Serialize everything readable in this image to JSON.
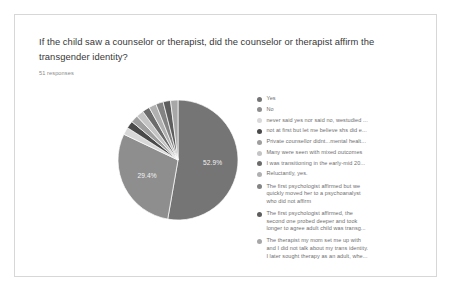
{
  "card": {
    "question": "If the child saw a counselor or therapist, did the counselor or therapist affirm the transgender identity?",
    "response_count": "51 responses"
  },
  "chart_data": {
    "type": "pie",
    "title": "If the child saw a counselor or therapist, did the counselor or therapist affirm the transgender identity?",
    "subtitle": "51 responses",
    "legend_position": "right",
    "total_responses": 51,
    "visible_labels": [
      "52.9%",
      "29.4%"
    ],
    "categories": [
      "Yes",
      "No",
      "never said yes nor said no, westudied ...",
      "not at first but let me believe shs did e...",
      "Private counsellor didnt...mental healt...",
      "Many were seen with mixed outcomes",
      "I was transitioning in the early-mid 20...",
      "Reluctantly, yes.",
      "The first psychologist affirmed but we quickly moved her to a psychoanalyst who did not affirm",
      "The first psychologist affirmed, the second one probed deeper and took longer to agree adult child was transg...",
      "The therapist my mom set me up with and I did not talk about my trans identity. I later sought therapy as an adult, whe..."
    ],
    "values": [
      52.9,
      29.4,
      2.0,
      2.0,
      2.0,
      2.0,
      2.0,
      2.0,
      2.0,
      2.0,
      2.0
    ],
    "colors": [
      "#757575",
      "#8e8e8e",
      "#d8d8d8",
      "#4a4a4a",
      "#9e9e9e",
      "#c4c4c4",
      "#6b6b6b",
      "#b0b0b0",
      "#838383",
      "#5d5d5d",
      "#a7a7a7"
    ],
    "data_labels": [
      {
        "category": "Yes",
        "label": "52.9%"
      },
      {
        "category": "No",
        "label": "29.4%"
      }
    ]
  },
  "legend": {
    "items": [
      {
        "label": "Yes",
        "color": "#757575",
        "multiline": false
      },
      {
        "label": "No",
        "color": "#8e8e8e",
        "multiline": false
      },
      {
        "label": "never said yes nor said no, westudied ...",
        "color": "#d8d8d8",
        "multiline": false
      },
      {
        "label": "not at first but let me believe shs did e...",
        "color": "#4a4a4a",
        "multiline": false
      },
      {
        "label": "Private counsellor didnt...mental healt...",
        "color": "#9e9e9e",
        "multiline": false
      },
      {
        "label": "Many were seen with mixed outcomes",
        "color": "#c4c4c4",
        "multiline": false
      },
      {
        "label": "I was transitioning in the early-mid 20...",
        "color": "#6b6b6b",
        "multiline": false
      },
      {
        "label": "Reluctantly, yes.",
        "color": "#b0b0b0",
        "multiline": false
      },
      {
        "label": "The first psychologist affirmed but we\nquickly moved her to a psychoanalyst\nwho did not affirm",
        "color": "#838383",
        "multiline": true
      },
      {
        "label": "The first psychologist affirmed, the\nsecond one probed deeper and took\nlonger to agree adult child was transg...",
        "color": "#5d5d5d",
        "multiline": true
      },
      {
        "label": "The therapist my mom set me up with\nand I did not talk about my trans identity.\nI later sought therapy as an adult, whe...",
        "color": "#a7a7a7",
        "multiline": true
      }
    ]
  }
}
